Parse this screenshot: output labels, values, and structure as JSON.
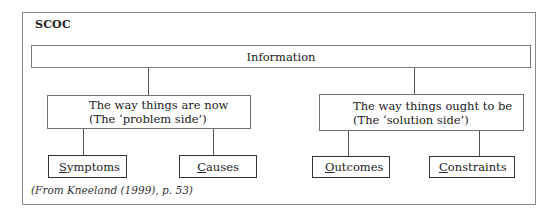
{
  "diagram": {
    "title": "SCOC",
    "root": {
      "label": "Information"
    },
    "branches": [
      {
        "line1": "The way things are now",
        "line2": "(The ‘problem side’)",
        "children": [
          {
            "first": "S",
            "rest": "ymptoms"
          },
          {
            "first": "C",
            "rest": "auses"
          }
        ]
      },
      {
        "line1": "The way things ought to be",
        "line2": "(The ‘solution side’)",
        "children": [
          {
            "first": "O",
            "rest": "utcomes"
          },
          {
            "first": "C",
            "rest": "onstraints"
          }
        ]
      }
    ],
    "caption": "(From Kneeland (1999), p. 53)"
  }
}
